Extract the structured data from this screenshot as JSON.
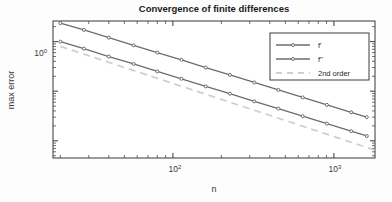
{
  "chart_data": {
    "type": "line",
    "title": "Convergence of finite differences",
    "xlabel": "n",
    "ylabel": "max error",
    "xscale": "log",
    "yscale": "log",
    "xlim": [
      18,
      1800
    ],
    "ylim": [
      0.0045,
      2.6
    ],
    "grid": false,
    "legend_position": "upper right",
    "xticks": [
      100,
      1000
    ],
    "xticklabels": [
      "10^2",
      "10^3"
    ],
    "yticks": [
      1
    ],
    "yticklabels": [
      "10^0"
    ],
    "series": [
      {
        "name": "f'",
        "label": "f'",
        "style": "solid-marker",
        "color": "#6b6b75",
        "x": [
          20,
          28,
          40,
          57,
          80,
          113,
          160,
          226,
          320,
          452,
          640,
          905,
          1280,
          1600
        ],
        "y": [
          2.35,
          1.72,
          1.2,
          0.84,
          0.6,
          0.43,
          0.3,
          0.213,
          0.15,
          0.106,
          0.075,
          0.053,
          0.0375,
          0.03
        ]
      },
      {
        "name": "f''",
        "label": "f''",
        "style": "solid-marker",
        "color": "#6b6b75",
        "x": [
          20,
          28,
          40,
          57,
          80,
          113,
          160,
          226,
          320,
          452,
          640,
          905,
          1280,
          1600
        ],
        "y": [
          1.0,
          0.72,
          0.5,
          0.355,
          0.25,
          0.178,
          0.125,
          0.089,
          0.0625,
          0.0445,
          0.0313,
          0.0222,
          0.0156,
          0.0125
        ]
      },
      {
        "name": "2nd order",
        "label": "2nd order",
        "style": "dashed",
        "color": "#cfcfcf",
        "x": [
          20,
          1800
        ],
        "y": [
          0.8,
          0.0065
        ]
      }
    ]
  },
  "legend": {
    "items": [
      {
        "label": "f'",
        "style": "solid-marker",
        "color": "#6b6b75"
      },
      {
        "label": "f''",
        "style": "solid-marker",
        "color": "#6b6b75"
      },
      {
        "label": "2nd order",
        "style": "dashed",
        "color": "#cfcfcf"
      }
    ]
  },
  "axes": {
    "title": "Convergence of finite differences",
    "x_label": "n",
    "y_label": "max error",
    "x_tick_base_1": "10",
    "x_tick_exp_1": "2",
    "x_tick_base_2": "10",
    "x_tick_exp_2": "3",
    "y_tick_base_1": "10",
    "y_tick_exp_1": "0"
  },
  "colors": {
    "line": "#6b6b75",
    "reference": "#cfcfcf",
    "axis": "#4a4a4a",
    "text": "#1f1f1f",
    "background": "#fdfdfd"
  }
}
